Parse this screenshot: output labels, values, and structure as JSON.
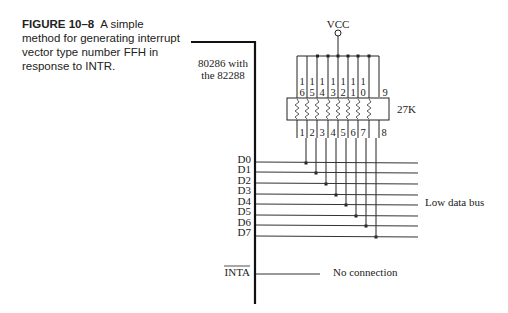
{
  "caption": {
    "figure_label": "FIGURE 10–8",
    "text": "A simple method for generating interrupt vector type number FFH in response to INTR."
  },
  "chip": {
    "label_line1": "80286 with",
    "label_line2": "the 82288",
    "pins": [
      "D0",
      "D1",
      "D2",
      "D3",
      "D4",
      "D5",
      "D6",
      "D7"
    ],
    "inta_label": "INTA"
  },
  "power": {
    "label": "VCC"
  },
  "resistor_pack": {
    "value": "27K",
    "top_pins": [
      "16",
      "15",
      "14",
      "13",
      "12",
      "11",
      "10",
      "9"
    ],
    "bottom_pins": [
      "1",
      "2",
      "3",
      "4",
      "5",
      "6",
      "7",
      "8"
    ]
  },
  "labels": {
    "bus": "Low data bus",
    "no_connection": "No connection"
  }
}
